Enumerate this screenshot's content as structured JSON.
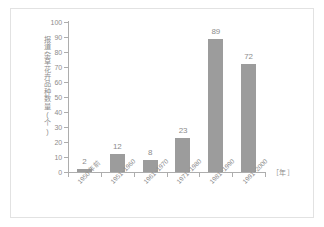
{
  "chart_data": {
    "type": "bar",
    "title": "",
    "subtitle": "",
    "xlabel": "［年］",
    "ylabel": "报道杂草花卉品种数量(个)",
    "categories": [
      "1950 年前",
      "1951~1960",
      "1961~1970",
      "1971~1980",
      "1981~1990",
      "1991~2000"
    ],
    "values": [
      2,
      12,
      8,
      23,
      89,
      72
    ],
    "value_labels": [
      "2",
      "12",
      "8",
      "23",
      "89",
      "72"
    ],
    "ylim": [
      0,
      100
    ],
    "ytick_labels": [
      "0",
      "10",
      "20",
      "30",
      "40",
      "50",
      "60",
      "70",
      "80",
      "90",
      "100"
    ],
    "ytick_values": [
      0,
      10,
      20,
      30,
      40,
      50,
      60,
      70,
      80,
      90,
      100
    ],
    "grid": false,
    "legend": "none",
    "bar_color": "#9c9c9c",
    "axis_color": "#adadad",
    "text_color": "#8c8c8c",
    "background_color": "#ffffff",
    "frame_color": "#e2e2e2"
  }
}
